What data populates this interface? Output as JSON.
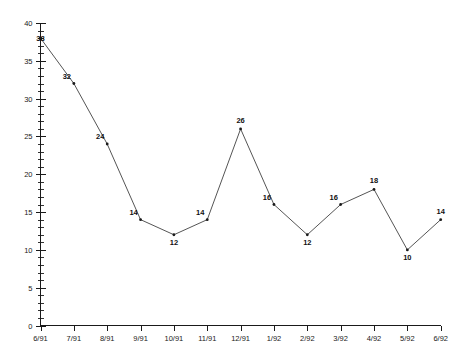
{
  "chart_data": {
    "type": "line",
    "title": "",
    "subtitle": "",
    "xlabel": "",
    "ylabel": "",
    "categories": [
      "6/91",
      "7/91",
      "8/91",
      "9/91",
      "10/91",
      "11/91",
      "12/91",
      "1/92",
      "2/92",
      "3/92",
      "4/92",
      "5/92",
      "6/92"
    ],
    "values": [
      38,
      32,
      24,
      14,
      12,
      14,
      26,
      16,
      12,
      16,
      18,
      10,
      14
    ],
    "point_labels": [
      "38",
      "32",
      "24",
      "14",
      "12",
      "14",
      "26",
      "16",
      "12",
      "16",
      "18",
      "10",
      "14"
    ],
    "ylim": [
      0,
      40
    ],
    "y_ticks_major": [
      0,
      5,
      10,
      15,
      20,
      25,
      30,
      35,
      40
    ],
    "y_tick_labels": [
      "0",
      "5",
      "10",
      "15",
      "20",
      "25",
      "30",
      "35",
      "40"
    ],
    "y_minor_step": 1,
    "grid": false,
    "legend": "none",
    "series": [
      {
        "name": "",
        "values": [
          38,
          32,
          24,
          14,
          12,
          14,
          26,
          16,
          12,
          16,
          18,
          10,
          14
        ],
        "color": "#555555",
        "marker": "dot"
      }
    ],
    "colors": {
      "axis": "#1a1a1a",
      "line": "#555555",
      "marker": "#1a1a1a",
      "text": "#111111",
      "background": "#ffffff"
    }
  }
}
